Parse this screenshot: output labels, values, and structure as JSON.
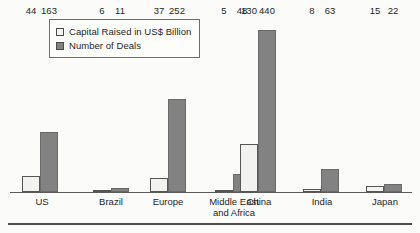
{
  "legend": {
    "entries": [
      {
        "label": "Capital Raised in US$ Billion",
        "swatch": "light-square-icon",
        "color": "#f2f2f0"
      },
      {
        "label": "Number of Deals",
        "swatch": "dark-square-icon",
        "color": "#828282"
      }
    ]
  },
  "chart_data": {
    "type": "bar",
    "title": "",
    "subtitle": "",
    "xlabel": "",
    "ylabel": "",
    "grid": false,
    "legend_position": "top-center",
    "axis": {
      "baseline_visible": true,
      "y_axis_visible": false,
      "ylim": [
        0,
        475
      ]
    },
    "categories": [
      "US",
      "Brazil",
      "Europe",
      "Middle East\nand Africa",
      "China",
      "India",
      "Japan"
    ],
    "series": [
      {
        "name": "Capital Raised in US$ Billion",
        "color": "#f2f2f0",
        "values": [
          44,
          6,
          37,
          5,
          130,
          8,
          15
        ]
      },
      {
        "name": "Number of Deals",
        "color": "#828282",
        "values": [
          163,
          11,
          252,
          48,
          440,
          63,
          22
        ]
      }
    ],
    "value_labels": [
      [
        "44",
        "163"
      ],
      [
        "6",
        "11"
      ],
      [
        "37",
        "252"
      ],
      [
        "5",
        "48"
      ],
      [
        "130",
        "440"
      ],
      [
        "8",
        "63"
      ],
      [
        "15",
        "22"
      ]
    ]
  },
  "layout": {
    "scale_px_per_unit": 0.3682,
    "baseline_y": 192,
    "bar_width": 18,
    "group_left": [
      22,
      93,
      150,
      215,
      240,
      303,
      366
    ],
    "label_left": [
      12,
      78,
      138,
      190,
      240,
      295,
      354
    ],
    "label_width": [
      60,
      60,
      60,
      90,
      60,
      60,
      60
    ]
  }
}
